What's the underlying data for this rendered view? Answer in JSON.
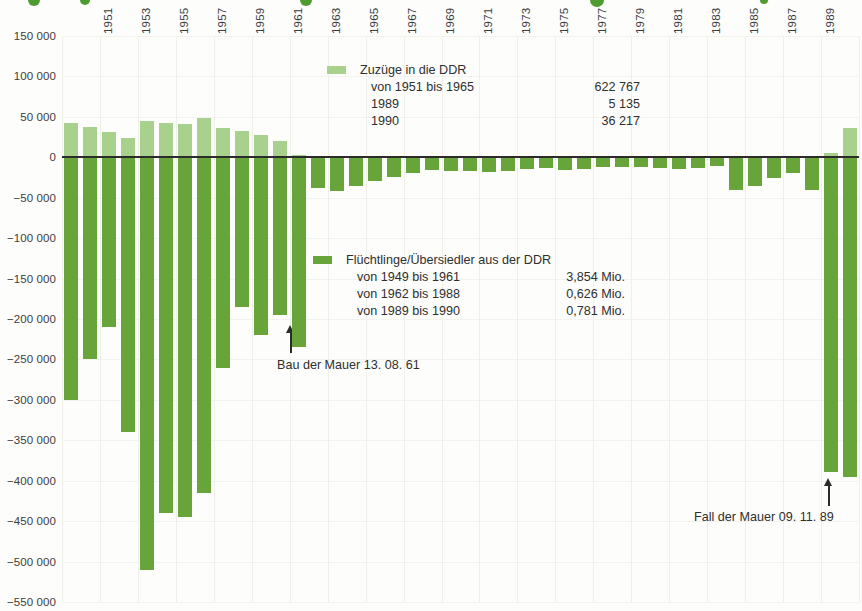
{
  "chart_data": {
    "type": "bar",
    "xlabel": "",
    "ylabel": "",
    "ylim": [
      -550000,
      150000
    ],
    "grid": true,
    "legend_position": "inside",
    "y_ticks": [
      "150 000",
      "100 000",
      "50 000",
      "0",
      "−50 000",
      "−100 000",
      "−150 000",
      "−200 000",
      "−250 000",
      "−300 000",
      "−350 000",
      "−400 000",
      "−450 000",
      "−500 000",
      "−550 000"
    ],
    "y_tick_values": [
      150000,
      100000,
      50000,
      0,
      -50000,
      -100000,
      -150000,
      -200000,
      -250000,
      -300000,
      -350000,
      -400000,
      -450000,
      -500000,
      -550000
    ],
    "x_tick_labels": [
      "1951",
      "1953",
      "1955",
      "1957",
      "1959",
      "1961",
      "1963",
      "1965",
      "1967",
      "1969",
      "1971",
      "1973",
      "1975",
      "1977",
      "1979",
      "1981",
      "1983",
      "1985",
      "1987",
      "1989"
    ],
    "categories": [
      "1949",
      "1950",
      "1951",
      "1952",
      "1953",
      "1954",
      "1955",
      "1956",
      "1957",
      "1958",
      "1959",
      "1960",
      "1961",
      "1962",
      "1963",
      "1964",
      "1965",
      "1966",
      "1967",
      "1968",
      "1969",
      "1970",
      "1971",
      "1972",
      "1973",
      "1974",
      "1975",
      "1976",
      "1977",
      "1978",
      "1979",
      "1980",
      "1981",
      "1982",
      "1983",
      "1984",
      "1985",
      "1986",
      "1987",
      "1988",
      "1989",
      "1990"
    ],
    "series": [
      {
        "name": "Zuzüge in die DDR",
        "color": "#a9d18e",
        "values": [
          42000,
          38000,
          31000,
          24000,
          45000,
          43000,
          41000,
          48000,
          36000,
          33000,
          28000,
          20000,
          3000,
          0,
          0,
          0,
          0,
          0,
          0,
          0,
          0,
          0,
          0,
          0,
          0,
          0,
          0,
          0,
          0,
          0,
          0,
          0,
          0,
          0,
          0,
          0,
          0,
          0,
          0,
          0,
          5135,
          36217
        ]
      },
      {
        "name": "Flüchtlinge/Übersiedler aus der DDR",
        "color": "#67a53b",
        "values": [
          -300000,
          -250000,
          -210000,
          -340000,
          -510000,
          -440000,
          -445000,
          -415000,
          -260000,
          -185000,
          -220000,
          -195000,
          -235000,
          -38000,
          -42000,
          -35000,
          -29000,
          -24000,
          -19000,
          -16000,
          -17000,
          -17000,
          -18000,
          -17000,
          -15000,
          -13000,
          -16000,
          -15000,
          -12000,
          -12000,
          -12000,
          -13000,
          -15000,
          -13000,
          -11000,
          -41000,
          -35000,
          -26000,
          -19000,
          -40000,
          -389000,
          -395000
        ]
      }
    ]
  },
  "y_axis": {
    "ticks": [
      {
        "label": "150 000",
        "value": 150000
      },
      {
        "label": "100 000",
        "value": 100000
      },
      {
        "label": "50 000",
        "value": 50000
      },
      {
        "label": "0",
        "value": 0
      },
      {
        "label": "−50 000",
        "value": -50000
      },
      {
        "label": "−100 000",
        "value": -100000
      },
      {
        "label": "−150 000",
        "value": -150000
      },
      {
        "label": "−200 000",
        "value": -200000
      },
      {
        "label": "−250 000",
        "value": -250000
      },
      {
        "label": "−300 000",
        "value": -300000
      },
      {
        "label": "−350 000",
        "value": -350000
      },
      {
        "label": "−400 000",
        "value": -400000
      },
      {
        "label": "−450 000",
        "value": -450000
      },
      {
        "label": "−500 000",
        "value": -500000
      },
      {
        "label": "−550 000",
        "value": -550000
      }
    ]
  },
  "legend_zuzuege": {
    "title": "Zuzüge in die DDR",
    "rows": [
      {
        "label": "von 1951 bis 1965",
        "value": "622 767"
      },
      {
        "label": "1989",
        "value": "5 135"
      },
      {
        "label": "1990",
        "value": "36 217"
      }
    ]
  },
  "legend_fluechtlinge": {
    "title": "Flüchtlinge/Übersiedler aus der DDR",
    "rows": [
      {
        "label": "von 1949 bis 1961",
        "value": "3,854 Mio."
      },
      {
        "label": "von 1962 bis 1988",
        "value": "0,626 Mio."
      },
      {
        "label": "von 1989 bis 1990",
        "value": "0,781 Mio."
      }
    ]
  },
  "annotations": {
    "wall_built": "Bau der Mauer 13. 08. 61",
    "wall_fell": "Fall der Mauer 09. 11. 89"
  },
  "colors": {
    "positive_bar": "#a9d18e",
    "negative_bar": "#67a53b",
    "zero_line": "#2b2b2b",
    "grid": "#eef0e9",
    "text": "#3a3a3a",
    "background": "#fdfdfb"
  }
}
